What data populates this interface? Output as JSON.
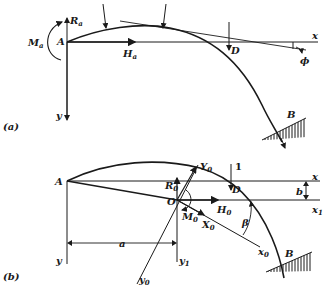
{
  "figure": {
    "panel_a": {
      "tag": "(a)",
      "labels": {
        "A": "A",
        "Ra": "R",
        "Ra_sub": "a",
        "Ma": "M",
        "Ma_sub": "a",
        "Ha": "H",
        "Ha_sub": "a",
        "D": "D",
        "B": "B",
        "x": "x",
        "y": "y",
        "phi": "ϕ"
      }
    },
    "panel_b": {
      "tag": "(b)",
      "labels": {
        "A": "A",
        "O": "O",
        "R0": "R",
        "R0_sub": "0",
        "M0": "M",
        "M0_sub": "0",
        "H0": "H",
        "H0_sub": "0",
        "X0": "X",
        "X0_sub": "0",
        "Y0": "Y",
        "Y0_sub": "0",
        "x0": "x",
        "x0_sub": "0",
        "y0": "y",
        "y0_sub": "0",
        "y1": "y",
        "y1_sub": "1",
        "x": "x",
        "x1": "x",
        "x1_sub": "1",
        "y": "y",
        "D": "D",
        "B": "B",
        "a": "a",
        "b": "b",
        "beta": "β",
        "load": "1"
      }
    }
  }
}
